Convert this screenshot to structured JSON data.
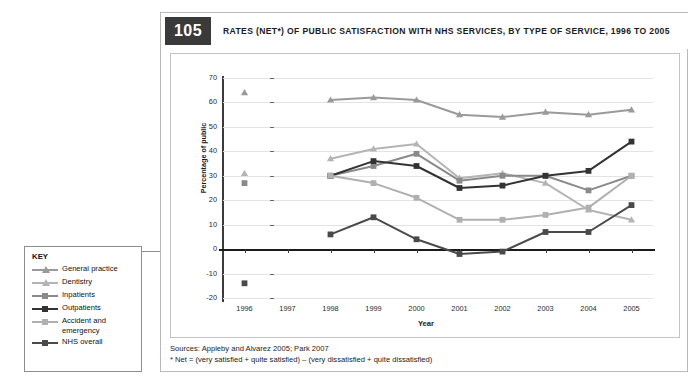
{
  "figure": {
    "number": "105",
    "title": "RATES (NET*) OF PUBLIC SATISFACTION WITH NHS SERVICES, BY TYPE OF SERVICE, 1996 TO 2005",
    "sources_line": "Sources: Appleby and Alvarez 2005; Park 2007",
    "note_line": "* Net = (very satisfied + quite satisfied) – (very dissatisfied + quite dissatisfied)"
  },
  "key": {
    "title": "KEY",
    "items": [
      {
        "label": "General practice",
        "color": "#9a9a9a",
        "marker": "triangle"
      },
      {
        "label": "Dentistry",
        "color": "#b4b4b4",
        "marker": "triangle"
      },
      {
        "label": "Inpatients",
        "color": "#8a8a8a",
        "marker": "square"
      },
      {
        "label": "Outpatients",
        "color": "#333333",
        "marker": "square"
      },
      {
        "label": "Accident and emergency",
        "color": "#b0b0b0",
        "marker": "square"
      },
      {
        "label": "NHS overall",
        "color": "#4a4a4a",
        "marker": "square"
      }
    ]
  },
  "chart_data": {
    "type": "line",
    "title": "RATES (NET*) OF PUBLIC SATISFACTION WITH NHS SERVICES, BY TYPE OF SERVICE, 1996 TO 2005",
    "xlabel": "Year",
    "ylabel": "Percentage of public",
    "x": [
      1996,
      1997,
      1998,
      1999,
      2000,
      2001,
      2002,
      2003,
      2004,
      2005
    ],
    "xticklabels": [
      "1996",
      "1997",
      "1998",
      "1999",
      "2000",
      "2001",
      "2002",
      "2003",
      "2004",
      "2005"
    ],
    "yticks": [
      -20,
      -10,
      0,
      10,
      20,
      30,
      40,
      50,
      60,
      70
    ],
    "yticklabels": [
      "-20",
      "-10",
      "0",
      "10",
      "20",
      "30",
      "40",
      "50",
      "60",
      "70"
    ],
    "ylim": [
      -20,
      70
    ],
    "grid": true,
    "legend_position": "external-left",
    "series": [
      {
        "name": "General practice",
        "color": "#9a9a9a",
        "marker": "triangle",
        "values": [
          64,
          null,
          61,
          62,
          61,
          55,
          54,
          56,
          55,
          57
        ]
      },
      {
        "name": "Dentistry",
        "color": "#b4b4b4",
        "marker": "triangle",
        "values": [
          31,
          null,
          37,
          41,
          43,
          29,
          31,
          27,
          16,
          12
        ]
      },
      {
        "name": "Inpatients",
        "color": "#8a8a8a",
        "marker": "square",
        "values": [
          27,
          null,
          30,
          34,
          39,
          28,
          30,
          30,
          24,
          30
        ]
      },
      {
        "name": "Outpatients",
        "color": "#333333",
        "marker": "square",
        "values": [
          null,
          null,
          30,
          36,
          34,
          25,
          26,
          30,
          32,
          44
        ]
      },
      {
        "name": "Accident and emergency",
        "color": "#b0b0b0",
        "marker": "square",
        "values": [
          null,
          null,
          30,
          27,
          21,
          12,
          12,
          14,
          17,
          30
        ]
      },
      {
        "name": "NHS overall",
        "color": "#4a4a4a",
        "marker": "square",
        "values": [
          -14,
          null,
          6,
          13,
          4,
          -2,
          -1,
          7,
          7,
          18
        ]
      }
    ]
  }
}
